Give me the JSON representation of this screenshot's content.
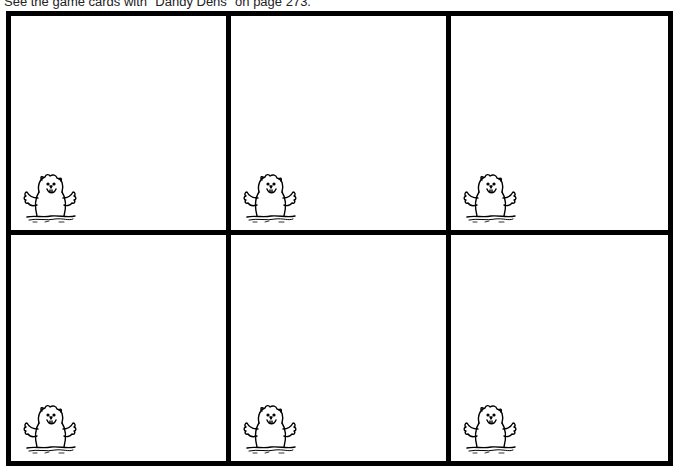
{
  "caption": "See the game cards with \"Dandy Dens\" on page 273.",
  "cards": [
    {
      "position": "row1-col1",
      "icon": "groundhog-icon",
      "text": ""
    },
    {
      "position": "row1-col2",
      "icon": "groundhog-icon",
      "text": ""
    },
    {
      "position": "row1-col3",
      "icon": "groundhog-icon",
      "text": ""
    },
    {
      "position": "row2-col1",
      "icon": "groundhog-icon",
      "text": ""
    },
    {
      "position": "row2-col2",
      "icon": "groundhog-icon",
      "text": ""
    },
    {
      "position": "row2-col3",
      "icon": "groundhog-icon",
      "text": ""
    }
  ],
  "colors": {
    "border": "#000000",
    "background": "#ffffff"
  }
}
